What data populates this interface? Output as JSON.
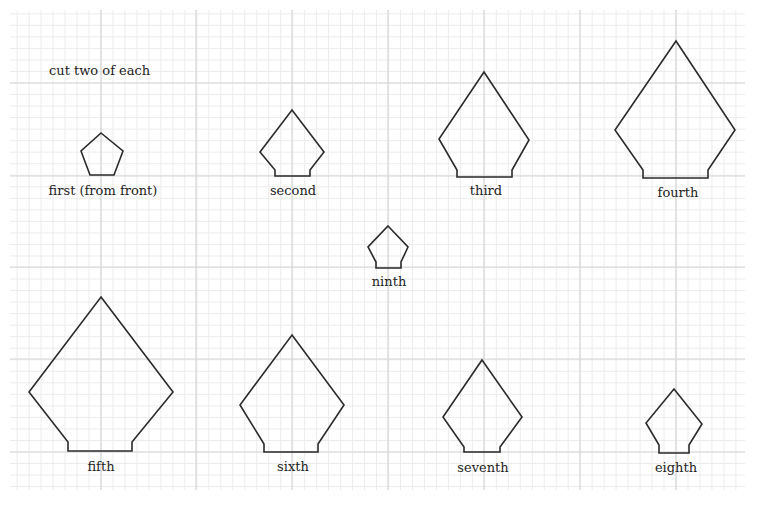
{
  "title": "cut two of each",
  "grid": {
    "left": 10,
    "top": 10,
    "right": 745,
    "bottom": 490,
    "minor_spacing": 12,
    "major_x": [
      101,
      196,
      292,
      388,
      484,
      580,
      676
    ],
    "major_y": [
      83,
      176,
      267,
      359,
      452
    ],
    "minor_color": "#ececec",
    "major_color": "#d6d6d6"
  },
  "stroke_color": "#2a2a2a",
  "pieces": [
    {
      "name": "first",
      "label": "first (from front)",
      "label_x": 103,
      "label_y": 195,
      "points": "101,133 123,151 114,175 90,175 81,151"
    },
    {
      "name": "second",
      "label": "second",
      "label_x": 293,
      "label_y": 195,
      "points": "292,110 324,152 310,170 310,176 275,176 275,170 260,152"
    },
    {
      "name": "third",
      "label": "third",
      "label_x": 486,
      "label_y": 195,
      "points": "484,72 529,140 512,170 512,177 457,177 457,170 439,139"
    },
    {
      "name": "fourth",
      "label": "fourth",
      "label_x": 678,
      "label_y": 197,
      "points": "676,41 735,130 708,170 708,178 643,178 643,170 615,130"
    },
    {
      "name": "ninth",
      "label": "ninth",
      "label_x": 389,
      "label_y": 286,
      "points": "388,226 408,247 401,262 401,268 376,268 376,262 368,247"
    },
    {
      "name": "fifth",
      "label": "fifth",
      "label_x": 101,
      "label_y": 471,
      "points": "101,297 173,392 132,442 132,451 68,451 68,442 29,392"
    },
    {
      "name": "sixth",
      "label": "sixth",
      "label_x": 293,
      "label_y": 471,
      "points": "292,335 344,405 318,444 318,452 264,452 264,444 240,405"
    },
    {
      "name": "seventh",
      "label": "seventh",
      "label_x": 483,
      "label_y": 472,
      "points": "482,360 522,417 500,447 500,452 464,452 464,447 443,417"
    },
    {
      "name": "eighth",
      "label": "eighth",
      "label_x": 676,
      "label_y": 472,
      "points": "674,389 702,424 689,445 689,453 659,453 659,445 646,423"
    }
  ]
}
